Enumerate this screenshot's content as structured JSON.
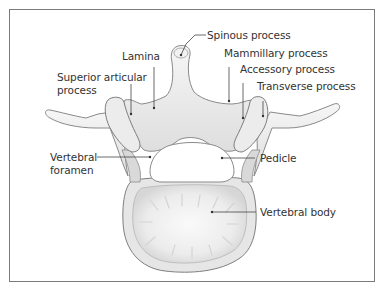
{
  "diagram": {
    "colors": {
      "frame": "#7a7a7a",
      "bone_fill": "#efefef",
      "bone_shade": "#cfcfcf",
      "bone_outline": "#8a8a8a",
      "leader_line": "#444444",
      "label_text": "#333333"
    },
    "labels": {
      "spinous_process": "Spinous process",
      "lamina": "Lamina",
      "mammillary_process": "Mammillary process",
      "superior_articular_process_line1": "Superior articular",
      "superior_articular_process_line2": "process",
      "accessory_process": "Accessory process",
      "transverse_process": "Transverse process",
      "vertebral_foramen_line1": "Vertebral",
      "vertebral_foramen_line2": "foramen",
      "pedicle": "Pedicle",
      "vertebral_body": "Vertebral body"
    }
  }
}
